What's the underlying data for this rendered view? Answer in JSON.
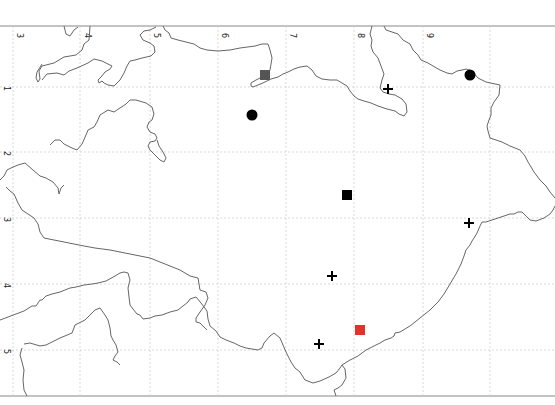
{
  "map": {
    "grid": {
      "col_labels": [
        "3",
        "4",
        "5",
        "6",
        "7",
        "8",
        "9"
      ],
      "row_labels": [
        "1",
        "2",
        "3",
        "4",
        "5"
      ]
    },
    "colors": {
      "coastline": "#666666",
      "grid": "#cccccc",
      "frame": "#888888",
      "marker_black": "#000000",
      "marker_gray": "#555555",
      "marker_red": "#e8302a"
    },
    "markers": [
      {
        "type": "square",
        "color": "gray",
        "x": 265,
        "y": 75,
        "label": "gray-square"
      },
      {
        "type": "circle",
        "color": "black",
        "x": 252,
        "y": 115,
        "label": "black-circle"
      },
      {
        "type": "cross",
        "color": "black",
        "x": 388,
        "y": 89,
        "label": "cross"
      },
      {
        "type": "circle",
        "color": "black",
        "x": 470,
        "y": 75,
        "label": "black-circle"
      },
      {
        "type": "square",
        "color": "black",
        "x": 347,
        "y": 195,
        "label": "black-square"
      },
      {
        "type": "cross",
        "color": "black",
        "x": 469,
        "y": 223,
        "label": "cross"
      },
      {
        "type": "cross",
        "color": "black",
        "x": 332,
        "y": 276,
        "label": "cross"
      },
      {
        "type": "square",
        "color": "red",
        "x": 360,
        "y": 330,
        "label": "red-square"
      },
      {
        "type": "cross",
        "color": "black",
        "x": 319,
        "y": 344,
        "label": "cross"
      }
    ]
  }
}
